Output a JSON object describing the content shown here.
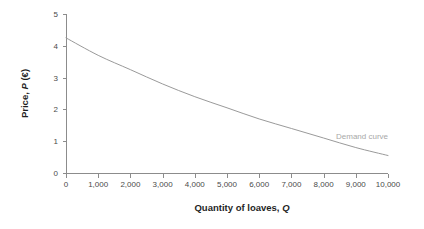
{
  "chart_data": {
    "type": "line",
    "title": "",
    "subtitle": "",
    "xlabel_plain": "Quantity of loaves,",
    "xlabel_var": "Q",
    "ylabel_plain": "Price,",
    "ylabel_var": "P",
    "ylabel_unit": "(€)",
    "xlabel_full": "Quantity of loaves, Q",
    "ylabel_full": "Price, P (€)",
    "x": [
      0,
      1000,
      2000,
      3000,
      4000,
      5000,
      6000,
      7000,
      8000,
      9000,
      10000
    ],
    "series": [
      {
        "name": "Demand curve",
        "values": [
          4.25,
          3.7,
          3.25,
          2.8,
          2.4,
          2.05,
          1.7,
          1.4,
          1.1,
          0.8,
          0.55
        ]
      }
    ],
    "xlim": [
      0,
      10000
    ],
    "ylim": [
      0,
      5
    ],
    "xticks": [
      0,
      1000,
      2000,
      3000,
      4000,
      5000,
      6000,
      7000,
      8000,
      9000,
      10000
    ],
    "xtick_labels": [
      "0",
      "1,000",
      "2,000",
      "3,000",
      "4,000",
      "5,000",
      "6,000",
      "7,000",
      "8,000",
      "9,000",
      "10,000"
    ],
    "yticks": [
      0,
      1,
      2,
      3,
      4,
      5
    ],
    "ytick_labels": [
      "0",
      "1",
      "2",
      "3",
      "4",
      "5"
    ],
    "grid": false,
    "legend": "none",
    "annotations": [
      {
        "name": "demand-curve-label",
        "text": "Demand curve",
        "x_px": 336,
        "y_px": 139,
        "color": "#a8a8a8"
      }
    ],
    "colors": {
      "curve": "#9a9a9a",
      "axis": "#8c8c8c",
      "tick_text": "#4a4a4a",
      "title_text": "#1f1f1f",
      "annotation": "#a8a8a8",
      "background": "#ffffff"
    }
  }
}
